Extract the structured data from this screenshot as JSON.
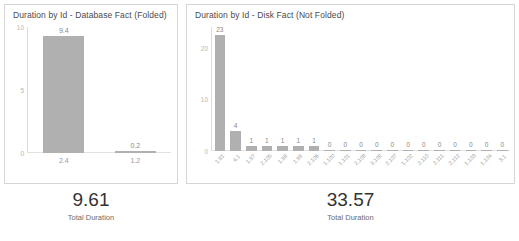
{
  "panels": [
    {
      "title": "Duration by Id - Database Fact (Folded)",
      "kpi": {
        "value": "9.61",
        "label": "Total Duration"
      }
    },
    {
      "title": "Duration by Id - Disk Fact (Not Folded)",
      "kpi": {
        "value": "33.57",
        "label": "Total Duration"
      }
    }
  ],
  "chart_data": [
    {
      "type": "bar",
      "title": "Duration by Id - Database Fact (Folded)",
      "xlabel": "",
      "ylabel": "",
      "categories": [
        "2.4",
        "1.2"
      ],
      "values": [
        9.4,
        0.2
      ],
      "data_labels": [
        "9.4",
        "0.2"
      ],
      "yticks": [
        "10",
        "5",
        "0"
      ],
      "ylim": [
        0,
        10
      ],
      "grid": false,
      "legend": false,
      "bar_color": "#b0b0b0"
    },
    {
      "type": "bar",
      "title": "Duration by Id - Disk Fact (Not Folded)",
      "xlabel": "",
      "ylabel": "",
      "categories": [
        "1.81",
        "4.1",
        "1.97",
        "2.105",
        "1.98",
        "1.99",
        "2.106",
        "1.100",
        "1.101",
        "2.108",
        "3.109",
        "2.107",
        "1.102",
        "2.110",
        "2.111",
        "2.112",
        "1.103",
        "1.104",
        "3.1"
      ],
      "values": [
        23,
        4,
        1,
        1,
        1,
        1,
        1,
        0,
        0,
        0,
        0,
        0,
        0,
        0,
        0,
        0,
        0,
        0,
        0
      ],
      "data_labels": [
        "23",
        "4",
        "1",
        "1",
        "1",
        "1",
        "1",
        "0",
        "0",
        "0",
        "0",
        "0",
        "0",
        "0",
        "0",
        "0",
        "0",
        "0",
        "0"
      ],
      "yticks": [
        "20",
        "10",
        "0"
      ],
      "ylim": [
        0,
        24
      ],
      "grid": false,
      "legend": false,
      "bar_color": "#b0b0b0"
    }
  ]
}
